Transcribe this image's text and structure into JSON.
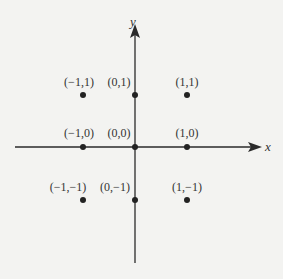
{
  "diagram": {
    "type": "coordinate-grid",
    "axes": {
      "x_label": "x",
      "y_label": "y"
    },
    "points": [
      {
        "label": "(−1,1)",
        "x": -1,
        "y": 1
      },
      {
        "label": "(0,1)",
        "x": 0,
        "y": 1
      },
      {
        "label": "(1,1)",
        "x": 1,
        "y": 1
      },
      {
        "label": "(−1,0)",
        "x": -1,
        "y": 0
      },
      {
        "label": "(0,0)",
        "x": 0,
        "y": 0
      },
      {
        "label": "(1,0)",
        "x": 1,
        "y": 0
      },
      {
        "label": "(−1,−1)",
        "x": -1,
        "y": -1
      },
      {
        "label": "(0,−1)",
        "x": 0,
        "y": -1
      },
      {
        "label": "(1,−1)",
        "x": 1,
        "y": -1
      }
    ],
    "colors": {
      "ink": "#2a2a2a",
      "background": "#f3f3f1"
    }
  }
}
